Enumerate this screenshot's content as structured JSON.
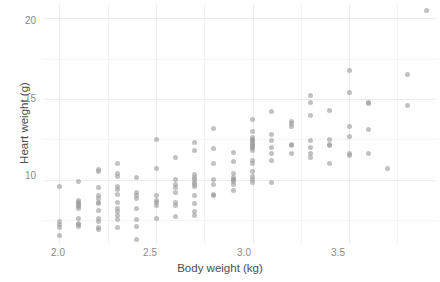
{
  "chart_data": {
    "type": "scatter",
    "title": "",
    "subtitle": "",
    "xlabel": "Body weight (kg)",
    "ylabel": "Heart weight (g)",
    "xlim": [
      1.92,
      3.95
    ],
    "ylim": [
      6.0,
      20.9
    ],
    "grid": true,
    "legend": null,
    "x_ticks": [
      2.0,
      2.5,
      3.0,
      3.5
    ],
    "x_tick_labels": [
      "2.0",
      "2.5",
      "3.0",
      "3.5"
    ],
    "y_ticks": [
      10,
      15,
      20
    ],
    "y_tick_labels": [
      "10",
      "15",
      "20"
    ],
    "x_minor_ticks": [
      2.25,
      2.75,
      3.25,
      3.75
    ],
    "y_minor_ticks": [
      7.5,
      12.5,
      17.5
    ],
    "point_color": "#9b9b9b",
    "point_opacity": 0.62,
    "point_size_px": 5,
    "panel_background": "#ffffff",
    "grid_major_color": "#ebebeb",
    "grid_minor_color": "#f4f4f4",
    "text_color": "#4d4d4d",
    "tick_text_color": "#8a8a8a",
    "n_points": 144,
    "series": [
      {
        "name": "cats",
        "x": [
          2.0,
          2.0,
          2.0,
          2.0,
          2.1,
          2.1,
          2.1,
          2.1,
          2.1,
          2.1,
          2.1,
          2.1,
          2.1,
          2.1,
          2.2,
          2.2,
          2.2,
          2.2,
          2.2,
          2.2,
          2.2,
          2.2,
          2.2,
          2.2,
          2.2,
          2.3,
          2.3,
          2.3,
          2.3,
          2.3,
          2.3,
          2.3,
          2.3,
          2.3,
          2.3,
          2.3,
          2.4,
          2.4,
          2.4,
          2.4,
          2.4,
          2.4,
          2.4,
          2.5,
          2.5,
          2.5,
          2.5,
          2.5,
          2.5,
          2.5,
          2.6,
          2.6,
          2.6,
          2.6,
          2.6,
          2.6,
          2.6,
          2.7,
          2.7,
          2.7,
          2.7,
          2.7,
          2.7,
          2.7,
          2.7,
          2.7,
          2.7,
          2.7,
          2.7,
          2.8,
          2.8,
          2.8,
          2.8,
          2.8,
          2.8,
          2.9,
          2.9,
          2.9,
          2.9,
          2.9,
          2.9,
          2.9,
          2.9,
          3.0,
          3.0,
          3.0,
          3.0,
          3.0,
          3.0,
          3.0,
          3.0,
          3.0,
          3.0,
          3.0,
          3.0,
          3.0,
          3.0,
          3.0,
          3.1,
          3.1,
          3.1,
          3.1,
          3.1,
          3.1,
          3.1,
          3.2,
          3.2,
          3.2,
          3.2,
          3.2,
          3.2,
          3.3,
          3.3,
          3.3,
          3.3,
          3.3,
          3.3,
          3.3,
          3.4,
          3.4,
          3.4,
          3.4,
          3.4,
          3.5,
          3.5,
          3.5,
          3.5,
          3.5,
          3.5,
          3.6,
          3.6,
          3.6,
          3.6,
          3.7,
          3.8,
          3.8,
          3.9,
          2.0,
          2.1,
          2.2,
          2.3,
          2.4,
          2.6,
          2.8,
          2.9,
          3.0,
          3.0
        ],
        "y": [
          6.5,
          7.0,
          7.4,
          9.6,
          7.1,
          7.2,
          7.3,
          7.6,
          8.3,
          8.4,
          8.5,
          8.6,
          8.7,
          9.9,
          6.9,
          7.0,
          7.4,
          7.6,
          8.1,
          8.5,
          8.6,
          8.8,
          9.5,
          10.5,
          10.6,
          7.0,
          7.5,
          7.8,
          8.2,
          8.6,
          9.1,
          9.4,
          9.6,
          10.2,
          11.0,
          10.4,
          6.3,
          7.1,
          7.5,
          8.8,
          9.0,
          9.2,
          10.1,
          7.6,
          8.4,
          8.6,
          8.7,
          9.0,
          10.7,
          12.5,
          7.7,
          8.4,
          8.6,
          9.2,
          9.7,
          10.0,
          11.4,
          7.8,
          8.0,
          8.5,
          9.0,
          9.6,
          9.7,
          9.8,
          10.0,
          10.1,
          10.3,
          11.8,
          12.3,
          9.1,
          9.7,
          10.0,
          11.0,
          11.9,
          13.2,
          9.3,
          9.7,
          9.9,
          10.0,
          10.1,
          10.4,
          11.1,
          11.7,
          9.8,
          10.0,
          10.2,
          10.5,
          11.2,
          11.8,
          12.0,
          12.1,
          12.2,
          12.3,
          12.4,
          12.5,
          12.6,
          13.0,
          13.7,
          9.8,
          11.2,
          11.6,
          12.0,
          12.4,
          12.8,
          14.2,
          11.6,
          12.1,
          12.2,
          13.3,
          13.5,
          13.6,
          11.4,
          11.6,
          12.0,
          12.4,
          14.0,
          14.8,
          15.2,
          11.0,
          12.1,
          12.2,
          12.5,
          14.3,
          11.6,
          12.7,
          15.4,
          16.8,
          13.3,
          11.5,
          11.6,
          13.1,
          14.7,
          14.8,
          10.7,
          14.6,
          16.5,
          20.5,
          7.2,
          8.2,
          9.0,
          8.0,
          8.2,
          9.5,
          9.0,
          10.0,
          11.0,
          12.0
        ]
      }
    ]
  },
  "axes": {
    "x_title": "Body weight (kg)",
    "y_title": "Heart weight (g)",
    "x_ticks": [
      "2.0",
      "2.5",
      "3.0",
      "3.5"
    ],
    "y_ticks": [
      "20",
      "15",
      "10"
    ]
  }
}
